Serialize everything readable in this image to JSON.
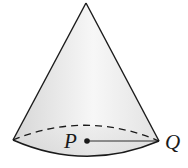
{
  "figure": {
    "type": "right-circular-cone",
    "labels": {
      "center_point": "P",
      "rim_point": "Q"
    },
    "colors": {
      "stroke": "#1a1a1a",
      "fill_light": "#f4f4f4",
      "fill_dark": "#d9d9d9",
      "background": "#ffffff"
    },
    "annotations": {
      "radius_segment": "P to Q",
      "hidden_base_edge": "dashed"
    }
  }
}
